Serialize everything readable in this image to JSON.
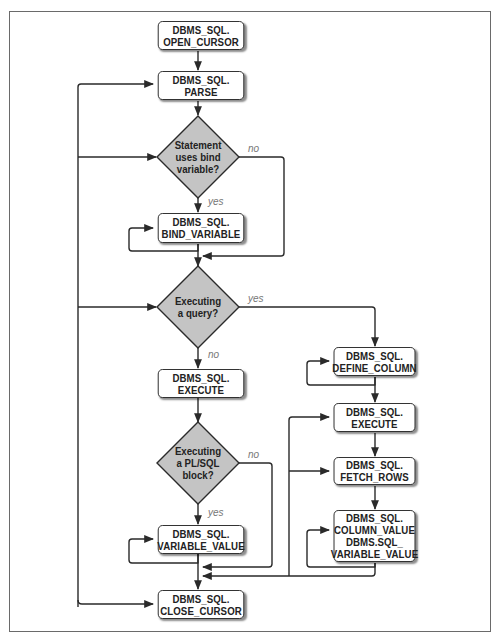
{
  "diagram": {
    "type": "flowchart",
    "nodes": {
      "open_cursor": {
        "line1": "DBMS_SQL.",
        "line2": "OPEN_CURSOR"
      },
      "parse": {
        "line1": "DBMS_SQL.",
        "line2": "PARSE"
      },
      "bind_variable": {
        "line1": "DBMS_SQL.",
        "line2": "BIND_VARIABLE"
      },
      "execute_left": {
        "line1": "DBMS_SQL.",
        "line2": "EXECUTE"
      },
      "variable_value": {
        "line1": "DBMS_SQL.",
        "line2": "VARIABLE_VALUE"
      },
      "close_cursor": {
        "line1": "DBMS_SQL.",
        "line2": "CLOSE_CURSOR"
      },
      "define_column": {
        "line1": "DBMS_SQL.",
        "line2": "DEFINE_COLUMN"
      },
      "execute_right": {
        "line1": "DBMS_SQL.",
        "line2": "EXECUTE"
      },
      "fetch_rows": {
        "line1": "DBMS_SQL.",
        "line2": "FETCH_ROWS"
      },
      "column_value": {
        "line1": "DBMS_SQL.",
        "line2": "COLUMN_VALUE",
        "line3": "DBMS.SQL_",
        "line4": "VARIABLE_VALUE"
      }
    },
    "decisions": {
      "bind": {
        "line1": "Statement",
        "line2": "uses bind",
        "line3": "variable?"
      },
      "query": {
        "line1": "Executing",
        "line2": "a query?"
      },
      "plsql": {
        "line1": "Executing",
        "line2": "a PL/SQL",
        "line3": "block?"
      }
    },
    "edge_labels": {
      "bind_no": "no",
      "bind_yes": "yes",
      "query_yes": "yes",
      "query_no": "no",
      "plsql_no": "no",
      "plsql_yes": "yes"
    },
    "colors": {
      "line": "#2a2a2a",
      "decision_fill": "#c4c4c4",
      "node_fill": "#ffffff",
      "edge_label": "#777777"
    }
  }
}
